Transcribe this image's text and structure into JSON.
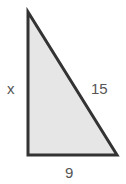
{
  "diagram": {
    "type": "right-triangle",
    "fill_color": "#e6e6e6",
    "stroke_color": "#333333",
    "labels": {
      "left_side": "x",
      "hypotenuse": "15",
      "bottom_side": "9"
    }
  }
}
